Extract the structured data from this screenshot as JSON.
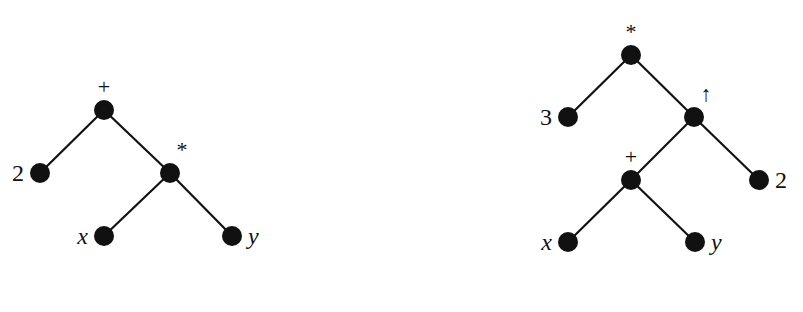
{
  "diagram": {
    "type": "expression-trees",
    "colors": {
      "node": "#111111",
      "edge": "#111111",
      "text": "#111111",
      "background": "#ffffff"
    },
    "top_text_cutoff": "",
    "trees": [
      {
        "id": "left",
        "expression": "2 + (x * y)",
        "nodes": [
          {
            "id": "L0",
            "label": "+",
            "kind": "operator",
            "x": 104,
            "y": 110,
            "label_pos": "above"
          },
          {
            "id": "L1",
            "label": "2",
            "kind": "leaf",
            "x": 40,
            "y": 173,
            "label_pos": "left"
          },
          {
            "id": "L2",
            "label": "*",
            "kind": "operator",
            "x": 170,
            "y": 173,
            "label_pos": "above-right"
          },
          {
            "id": "L3",
            "label": "x",
            "kind": "leaf",
            "x": 104,
            "y": 236,
            "label_pos": "left"
          },
          {
            "id": "L4",
            "label": "y",
            "kind": "leaf",
            "x": 232,
            "y": 236,
            "label_pos": "right"
          }
        ],
        "edges": [
          [
            "L0",
            "L1"
          ],
          [
            "L0",
            "L2"
          ],
          [
            "L2",
            "L3"
          ],
          [
            "L2",
            "L4"
          ]
        ]
      },
      {
        "id": "right",
        "expression": "3 * ((x + y) ↑ 2)",
        "nodes": [
          {
            "id": "R0",
            "label": "*",
            "kind": "operator",
            "x": 631,
            "y": 55,
            "label_pos": "above"
          },
          {
            "id": "R1",
            "label": "3",
            "kind": "leaf",
            "x": 568,
            "y": 117,
            "label_pos": "left"
          },
          {
            "id": "R2",
            "label": "↑",
            "kind": "operator",
            "x": 694,
            "y": 117,
            "label_pos": "above-right"
          },
          {
            "id": "R3",
            "label": "+",
            "kind": "operator",
            "x": 631,
            "y": 180,
            "label_pos": "above"
          },
          {
            "id": "R4",
            "label": "2",
            "kind": "leaf",
            "x": 759,
            "y": 180,
            "label_pos": "right"
          },
          {
            "id": "R5",
            "label": "x",
            "kind": "leaf",
            "x": 568,
            "y": 242,
            "label_pos": "left"
          },
          {
            "id": "R6",
            "label": "y",
            "kind": "leaf",
            "x": 695,
            "y": 242,
            "label_pos": "right"
          }
        ],
        "edges": [
          [
            "R0",
            "R1"
          ],
          [
            "R0",
            "R2"
          ],
          [
            "R2",
            "R3"
          ],
          [
            "R2",
            "R4"
          ],
          [
            "R3",
            "R5"
          ],
          [
            "R3",
            "R6"
          ]
        ]
      }
    ]
  }
}
